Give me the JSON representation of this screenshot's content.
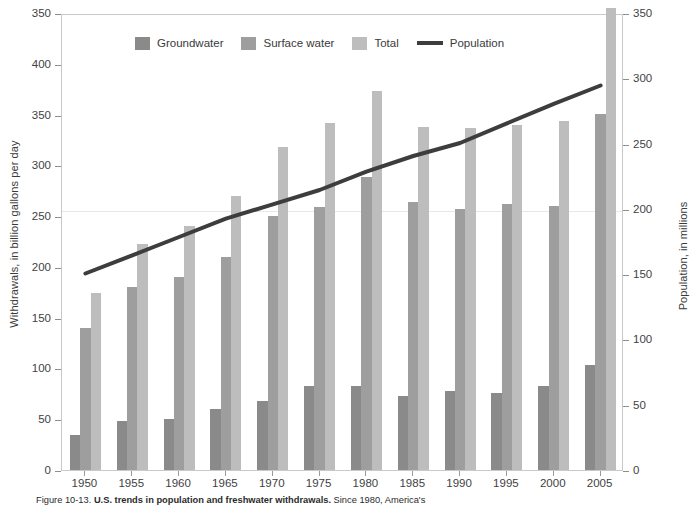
{
  "figure": {
    "caption_prefix": "Figure 10-13.",
    "caption_bold": "U.S. trends in population and freshwater withdrawals.",
    "caption_rest": "Since 1980, America's"
  },
  "legend": {
    "position": "top-left-inside",
    "items": [
      {
        "label": "Groundwater",
        "color": "#8a8a8a",
        "marker": "swatch"
      },
      {
        "label": "Surface water",
        "color": "#9e9e9e",
        "marker": "swatch"
      },
      {
        "label": "Total",
        "color": "#bdbdbd",
        "marker": "swatch"
      },
      {
        "label": "Population",
        "color": "#3d3d3d",
        "marker": "line"
      }
    ]
  },
  "axes": {
    "left": {
      "title": "Withdrawals, in billion gallons per day",
      "ticks": [
        "350",
        "400",
        "350",
        "300",
        "250",
        "200",
        "150",
        "100",
        "50",
        "0"
      ],
      "range": [
        0,
        450
      ]
    },
    "right": {
      "title": "Population, in millions",
      "ticks": [
        "350",
        "300",
        "250",
        "200",
        "150",
        "100",
        "50",
        "0"
      ],
      "range": [
        0,
        350
      ]
    },
    "x": {
      "title": "",
      "ticks": [
        "1950",
        "1955",
        "1960",
        "1965",
        "1970",
        "1975",
        "1980",
        "1985",
        "1990",
        "1995",
        "2000",
        "2005"
      ]
    }
  },
  "chart_data": {
    "type": "bar",
    "title": "U.S. trends in population and freshwater withdrawals",
    "xlabel": "",
    "ylabel": "Withdrawals, in billion gallons per day",
    "y2label": "Population, in millions",
    "ylim": [
      0,
      450
    ],
    "y2lim": [
      0,
      350
    ],
    "grid": false,
    "legend_position": "top-left",
    "categories": [
      "1950",
      "1955",
      "1960",
      "1965",
      "1970",
      "1975",
      "1980",
      "1985",
      "1990",
      "1995",
      "2000",
      "2005"
    ],
    "series": [
      {
        "name": "Groundwater",
        "type": "bar",
        "axis": "left",
        "color": "#8a8a8a",
        "units": "billion gallons per day",
        "values": [
          34,
          48,
          50,
          60,
          68,
          83,
          83,
          73,
          78,
          76,
          83,
          103
        ]
      },
      {
        "name": "Surface water",
        "type": "bar",
        "axis": "left",
        "color": "#9e9e9e",
        "units": "billion gallons per day",
        "values": [
          140,
          180,
          190,
          210,
          250,
          259,
          289,
          264,
          257,
          262,
          260,
          351
        ]
      },
      {
        "name": "Total",
        "type": "bar",
        "axis": "left",
        "color": "#bdbdbd",
        "units": "billion gallons per day",
        "values": [
          174,
          223,
          240,
          270,
          318,
          342,
          373,
          338,
          337,
          340,
          344,
          455
        ]
      },
      {
        "name": "Population",
        "type": "line",
        "axis": "right",
        "color": "#3d3d3d",
        "units": "millions",
        "values": [
          152,
          166,
          180,
          194,
          205,
          216,
          230,
          242,
          252,
          267,
          282,
          296
        ]
      }
    ]
  }
}
